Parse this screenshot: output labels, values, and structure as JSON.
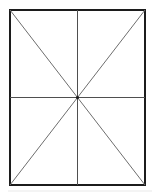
{
  "figure": {
    "name": "rectangle-with-diagonals-and-medians",
    "background_color": "#ffffff",
    "canvas": {
      "width": 159,
      "height": 195
    },
    "rectangle": {
      "x": 10,
      "y": 10,
      "width": 135,
      "height": 175,
      "stroke_color": "#1c1c1c",
      "stroke_width": 2,
      "fill_color": "#ffffff",
      "corners": {
        "top_left": [
          10,
          10
        ],
        "top_right": [
          145,
          10
        ],
        "bottom_right": [
          145,
          185
        ],
        "bottom_left": [
          10,
          185
        ]
      }
    },
    "center_point": {
      "x": 77.5,
      "y": 97.5,
      "color": "#1c1c1c",
      "radius": 1.6
    },
    "diagonals": [
      {
        "label": "diagonal-top-left-to-bottom-right",
        "x1": 10,
        "y1": 10,
        "x2": 145,
        "y2": 185,
        "stroke_color": "#6e6e6e",
        "stroke_width": 1
      },
      {
        "label": "diagonal-top-right-to-bottom-left",
        "x1": 145,
        "y1": 10,
        "x2": 10,
        "y2": 185,
        "stroke_color": "#6e6e6e",
        "stroke_width": 1
      }
    ],
    "medians": [
      {
        "label": "median-vertical",
        "x1": 77.5,
        "y1": 10,
        "x2": 77.5,
        "y2": 185,
        "stroke_color": "#4f4f4f",
        "stroke_width": 1
      },
      {
        "label": "median-horizontal",
        "x1": 10,
        "y1": 97.5,
        "x2": 145,
        "y2": 97.5,
        "stroke_color": "#4f4f4f",
        "stroke_width": 1
      }
    ],
    "artifacts": [
      {
        "label": "scan-artifact-bottom",
        "x1": 8,
        "y1": 191,
        "x2": 152,
        "y2": 191,
        "stroke_color": "#e9e9e9",
        "stroke_width": 1
      }
    ]
  }
}
